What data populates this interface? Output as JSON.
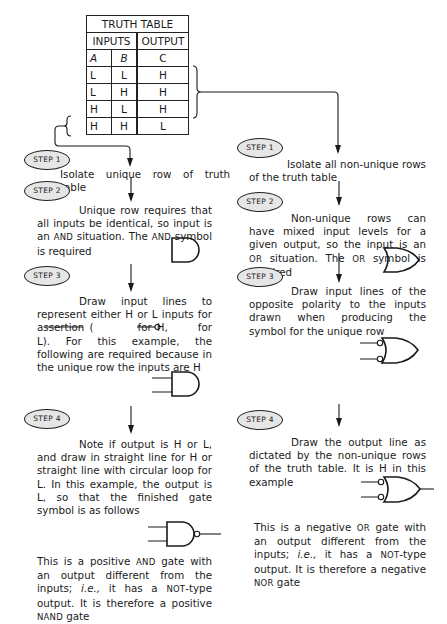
{
  "truth_table": {
    "title": "TRUTH TABLE",
    "group_headers": [
      "INPUTS",
      "OUTPUT"
    ],
    "columns": [
      "A",
      "B",
      "C"
    ],
    "rows": [
      [
        "L",
        "L",
        "H"
      ],
      [
        "L",
        "H",
        "H"
      ],
      [
        "H",
        "L",
        "H"
      ],
      [
        "H",
        "H",
        "L"
      ]
    ]
  },
  "left_column": {
    "steps": [
      {
        "label": "STEP 1",
        "text": "Isolate unique row of truth table"
      },
      {
        "label": "STEP 2",
        "text": "Unique row requires that all inputs be identical, so input is an AND situation. The AND symbol is required"
      },
      {
        "label": "STEP 3",
        "text_a": "Draw input lines to represent either H or L inputs for assertion (",
        "text_b": "for H,",
        "text_c": "for L). For this example, the following are required because in the unique row the inputs are H"
      },
      {
        "label": "STEP 4",
        "text": "Note if output is H or L, and draw in straight line for H or straight line with circular loop for L. In this example, the output is L, so that the finished gate symbol is as follows"
      }
    ],
    "conclusion": {
      "p1": "This is a positive",
      "and": "AND",
      "p2": "gate with an output different from the inputs;",
      "ie": "i.e.,",
      "p3": "it has a",
      "not": "NOT",
      "p4": "-type output. It is therefore a positive",
      "nand": "NAND",
      "p5": "gate"
    }
  },
  "right_column": {
    "steps": [
      {
        "label": "STEP 1",
        "text": "Isolate all non-unique rows of the truth table"
      },
      {
        "label": "STEP 2",
        "text": "Non-unique rows can have mixed input levels for a given output, so the input is an OR situation. The OR symbol is required"
      },
      {
        "label": "STEP 3",
        "text": "Draw input lines of the opposite polarity to the inputs drawn when producing the symbol for the unique row"
      },
      {
        "label": "STEP 4",
        "text": "Draw the output line as dictated by the non-unique rows of the truth table. It is H in this example"
      }
    ],
    "conclusion": {
      "p1": "This is a negative",
      "or": "OR",
      "p2": "gate with an output different from the inputs;",
      "ie": "i.e.,",
      "p3": "it has a",
      "not": "NOT",
      "p4": "-type output. It is therefore a negative",
      "nor": "NOR",
      "p5": "gate"
    }
  },
  "symbols": [
    "and-gate",
    "and-gate-with-inputs",
    "nand-gate",
    "or-gate",
    "negative-input-or-gate",
    "negative-or-gate-with-output"
  ]
}
